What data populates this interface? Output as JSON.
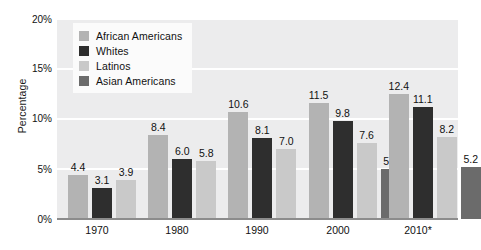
{
  "chart_data": {
    "type": "bar",
    "title": "",
    "subtitle": "",
    "xlabel": "",
    "ylabel": "Percentage",
    "categories": [
      "1970",
      "1980",
      "1990",
      "2000",
      "2010*"
    ],
    "ylim": [
      0,
      20
    ],
    "y_tick_labels": [
      "0%",
      "5%",
      "10%",
      "15%",
      "20%"
    ],
    "y_ticks": [
      0,
      5,
      10,
      15,
      20
    ],
    "grid": true,
    "legend_position": "upper-left-inside",
    "series": [
      {
        "name": "African Americans",
        "color": "#b3b3b3",
        "values": [
          4.4,
          8.4,
          10.6,
          11.5,
          12.4
        ],
        "labels": [
          "4.4",
          "8.4",
          "10.6",
          "11.5",
          "12.4"
        ]
      },
      {
        "name": "Whites",
        "color": "#2e2e2e",
        "values": [
          3.1,
          6.0,
          8.1,
          9.8,
          11.1
        ],
        "labels": [
          "3.1",
          "6.0",
          "8.1",
          "9.8",
          "11.1"
        ]
      },
      {
        "name": "Latinos",
        "color": "#c9c9c9",
        "values": [
          3.9,
          5.8,
          7.0,
          7.6,
          8.2
        ],
        "labels": [
          "3.9",
          "5.8",
          "7.0",
          "7.6",
          "8.2"
        ]
      },
      {
        "name": "Asian Americans",
        "color": "#6b6b6b",
        "values": [
          null,
          null,
          null,
          5.0,
          5.2
        ],
        "labels": [
          "",
          "",
          "",
          "5.0",
          "5.2"
        ]
      }
    ],
    "plot_background": "#ececed",
    "gridline_color": "#ffffff",
    "axis_color": "#8c8c8c"
  },
  "axes": {
    "y_title": "Percentage",
    "y_tick_0": "0%",
    "y_tick_1": "5%",
    "y_tick_2": "10%",
    "y_tick_3": "15%",
    "y_tick_4": "20%",
    "x_tick_0": "1970",
    "x_tick_1": "1980",
    "x_tick_2": "1990",
    "x_tick_3": "2000",
    "x_tick_4": "2010*"
  },
  "legend": {
    "items": [
      {
        "label": "African Americans",
        "color": "#b3b3b3"
      },
      {
        "label": "Whites",
        "color": "#2e2e2e"
      },
      {
        "label": "Latinos",
        "color": "#c9c9c9"
      },
      {
        "label": "Asian Americans",
        "color": "#6b6b6b"
      }
    ]
  }
}
